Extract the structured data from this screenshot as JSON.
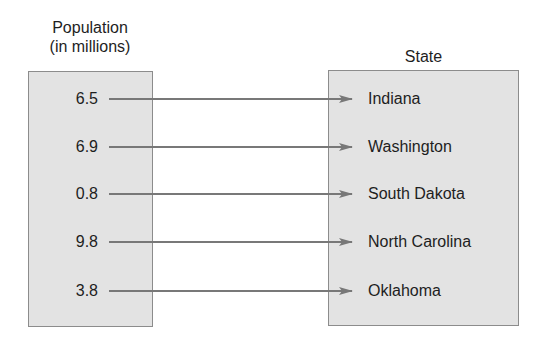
{
  "left_header": {
    "line1": "Population",
    "line2": "(in millions)"
  },
  "right_header": "State",
  "colors": {
    "box_fill": "#e3e3e3",
    "box_border": "#8c8c8c",
    "arrow": "#787878"
  },
  "mapping": [
    {
      "population": "6.5",
      "state": "Indiana"
    },
    {
      "population": "6.9",
      "state": "Washington"
    },
    {
      "population": "0.8",
      "state": "South Dakota"
    },
    {
      "population": "9.8",
      "state": "North Carolina"
    },
    {
      "population": "3.8",
      "state": "Oklahoma"
    }
  ]
}
